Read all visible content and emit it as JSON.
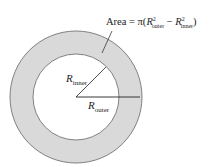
{
  "diagram": {
    "formula": {
      "prefix": "Area = π(",
      "r1": "R",
      "r1_sup": "2",
      "r1_sub": "outer",
      "minus": " − ",
      "r2": "R",
      "r2_sup": "2",
      "r2_sub": "inner",
      "suffix": ")"
    },
    "labels": {
      "inner": {
        "main": "R",
        "sub": "inner"
      },
      "outer": {
        "main": "R",
        "sub": "outer"
      }
    },
    "colors": {
      "ring_fill": "#d9d9d9",
      "stroke": "#555555",
      "inner_fill": "#ffffff"
    }
  }
}
